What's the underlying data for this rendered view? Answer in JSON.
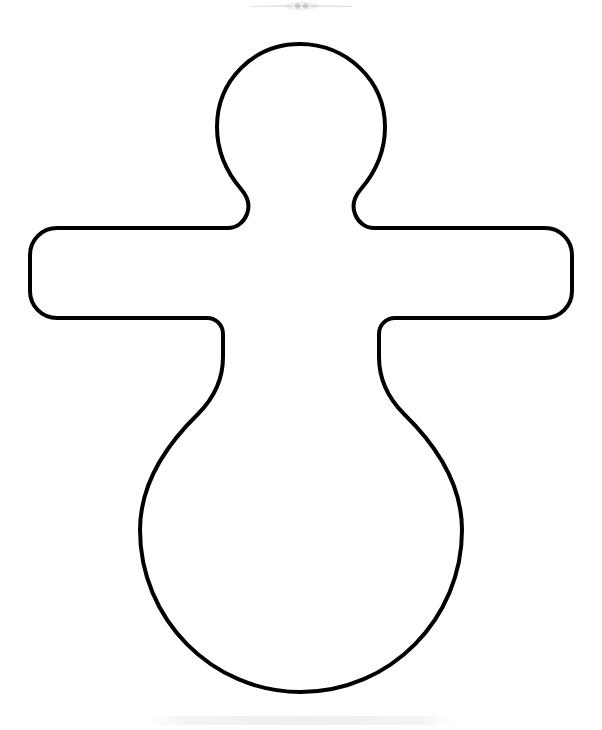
{
  "page": {
    "background_color": "#ffffff",
    "width": 602,
    "height": 730,
    "type": "coloring-page-outline"
  },
  "artwork": {
    "subject": "doll-outline",
    "description": "Simple outline drawing of a doll / gingerbread-style figure with a round head, short tapered neck, straight horizontal rounded arms and a large pear-shaped body.",
    "stroke_color": "#000000",
    "fill_color": "#ffffff",
    "stroke_width": 4,
    "parts": [
      {
        "name": "head",
        "shape": "circle",
        "cx": 300,
        "cy": 127,
        "r": 84
      },
      {
        "name": "neck",
        "shape": "tapered-column",
        "top_y": 196,
        "bottom_y": 228,
        "left_x": 240,
        "right_x": 360
      },
      {
        "name": "left-arm",
        "shape": "stadium",
        "x": 30,
        "y": 228,
        "width": 195,
        "height": 90
      },
      {
        "name": "right-arm",
        "shape": "stadium",
        "x": 377,
        "y": 228,
        "width": 195,
        "height": 90
      },
      {
        "name": "torso",
        "shape": "tapered-waist",
        "top_y": 228,
        "bottom_y": 400
      },
      {
        "name": "body",
        "shape": "oval",
        "cx": 301,
        "cy": 530,
        "rx": 161,
        "ry": 162
      }
    ],
    "bounds": {
      "left": 30,
      "top": 44,
      "right": 572,
      "bottom": 692
    }
  },
  "top_divider": {
    "name": "ornamental-divider",
    "color": "#9aa0ab",
    "opacity": 0.55,
    "center_x": 300,
    "center_y": 6,
    "span_left": 250,
    "span_right": 350
  },
  "bottom_watermark": {
    "name": "faint-watermark-band",
    "color": "#f0f0f0",
    "opacity": 0.85,
    "left": 155,
    "right": 455,
    "center_y": 718
  }
}
